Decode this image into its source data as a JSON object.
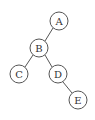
{
  "diagram": {
    "type": "binary-tree",
    "nodes": [
      {
        "id": "A",
        "label": "A",
        "cx": 59,
        "cy": 21
      },
      {
        "id": "B",
        "label": "B",
        "cx": 39,
        "cy": 48
      },
      {
        "id": "C",
        "label": "C",
        "cx": 19,
        "cy": 74
      },
      {
        "id": "D",
        "label": "D",
        "cx": 58,
        "cy": 74
      },
      {
        "id": "E",
        "label": "E",
        "cx": 78,
        "cy": 100
      }
    ],
    "edges": [
      {
        "from": "A",
        "to": "B"
      },
      {
        "from": "B",
        "to": "C"
      },
      {
        "from": "B",
        "to": "D"
      },
      {
        "from": "D",
        "to": "E"
      }
    ],
    "node_radius": 9,
    "stroke_color": "#555555"
  }
}
